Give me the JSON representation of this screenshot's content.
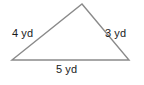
{
  "figure": {
    "kind": "geometry-figure",
    "shape": "triangle",
    "background_color": "#ffffff",
    "stroke_color": "#8a8a8a",
    "text_color": "#1a1a1a",
    "stroke_width": 1.4,
    "unit": "yd",
    "vertices": {
      "apex": {
        "x": 82,
        "y": 4
      },
      "bottom_left": {
        "x": 12,
        "y": 60
      },
      "bottom_right": {
        "x": 129,
        "y": 60
      }
    },
    "labels": {
      "left_side": "4 yd",
      "right_side": "3 yd",
      "bottom_side": "5 yd"
    }
  },
  "chart_data": {
    "type": "diagram",
    "title": "",
    "shape": "triangle",
    "sides": [
      {
        "name": "left",
        "label": "4 yd",
        "value": 4,
        "unit": "yd"
      },
      {
        "name": "right",
        "label": "3 yd",
        "value": 3,
        "unit": "yd"
      },
      {
        "name": "bottom",
        "label": "5 yd",
        "value": 5,
        "unit": "yd"
      }
    ]
  }
}
